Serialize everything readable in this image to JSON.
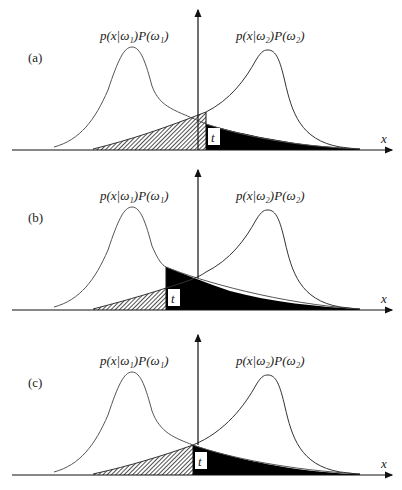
{
  "figure": {
    "panels": [
      {
        "id": "a",
        "label": "(a)",
        "offset_y": 0,
        "curve1_label": "p(x|ω₁)P(ω₁)",
        "curve2_label": "p(x|ω₂)P(ω₂)",
        "threshold_label": "t",
        "axis_label": "x",
        "threshold_position": "right of curve intersection"
      },
      {
        "id": "b",
        "label": "(b)",
        "offset_y": 160,
        "curve1_label": "p(x|ω₁)P(ω₁)",
        "curve2_label": "p(x|ω₂)P(ω₂)",
        "threshold_label": "t",
        "axis_label": "x",
        "threshold_position": "left of curve intersection"
      },
      {
        "id": "c",
        "label": "(c)",
        "offset_y": 320,
        "curve1_label": "p(x|ω₁)P(ω₁)",
        "curve2_label": "p(x|ω₂)P(ω₂)",
        "threshold_label": "t",
        "axis_label": "x",
        "threshold_position": "at curve intersection"
      }
    ],
    "colors": {
      "curve": "#555555",
      "axis": "#111111",
      "dark_fill": "#000000",
      "hatch": "#222222",
      "background": "#ffffff"
    }
  }
}
